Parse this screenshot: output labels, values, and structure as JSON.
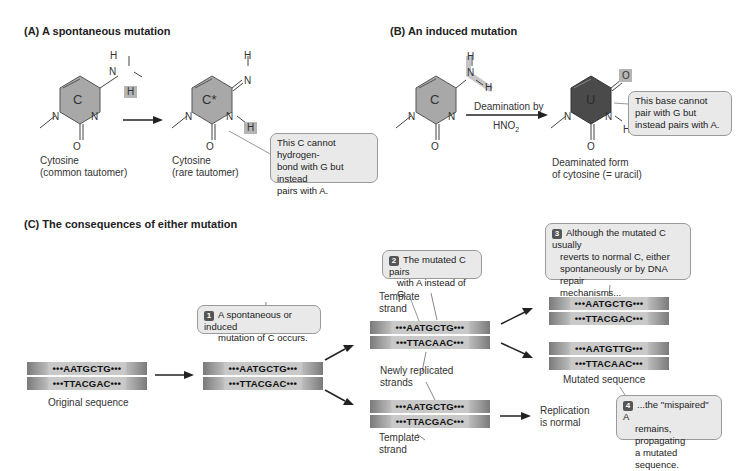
{
  "panel_a": {
    "title": "(A)  A spontaneous mutation",
    "molecule1": {
      "ring_label": "C",
      "atoms": {
        "h_top": "H",
        "n_amino": "N",
        "h_highlight": "H",
        "n_ring_left": "N",
        "n_ring_right": "N",
        "o": "O"
      },
      "caption_line1": "Cytosine",
      "caption_line2": "(common tautomer)"
    },
    "molecule2": {
      "ring_label": "C*",
      "atoms": {
        "h_top": "H",
        "n_imino": "N",
        "n_ring_left": "N",
        "n_ring_right": "N",
        "h_highlight": "H",
        "o": "O"
      },
      "caption_line1": "Cytosine",
      "caption_line2": "(rare tautomer)"
    },
    "callout": {
      "line1": "This C cannot hydrogen-",
      "line2": "bond with G but instead",
      "line3": "pairs with A."
    }
  },
  "panel_b": {
    "title": "(B)  An induced mutation",
    "molecule1": {
      "ring_label": "C",
      "atoms": {
        "h_top": "H",
        "n_amino": "N",
        "h_right": "H",
        "n_ring_left": "N",
        "n_ring_right": "N",
        "o": "O"
      }
    },
    "arrow_label_line1": "Deamination by",
    "arrow_label_line2": "HNO",
    "arrow_label_sub": "2",
    "molecule2": {
      "ring_label": "U",
      "atoms": {
        "o_highlight": "O",
        "n_ring_left": "N",
        "n_ring_right": "N",
        "h": "H",
        "o": "O"
      },
      "caption_line1": "Deaminated form",
      "caption_line2": "of cytosine (= uracil)"
    },
    "callout": {
      "line1": "This base cannot",
      "line2": "pair with G but",
      "line3": "instead pairs with A."
    }
  },
  "panel_c": {
    "title": "(C)  The consequences of either mutation",
    "original": {
      "top": "•••AATGCTG•••",
      "bottom": "•••TTACGAC•••",
      "caption": "Original sequence"
    },
    "mutated_c": {
      "top": "•••AATGCTG•••",
      "bottom": "•••TTACGAC•••"
    },
    "step1": {
      "num": "1",
      "line1": "A spontaneous or induced",
      "line2": "mutation of C occurs."
    },
    "step2": {
      "num": "2",
      "line1": "The mutated C pairs",
      "line2": "with A instead of G."
    },
    "step3": {
      "num": "3",
      "line1": "Although the mutated C usually",
      "line2": "reverts to normal C, either",
      "line3": "spontaneously or by DNA repair",
      "line4": "mechanisms..."
    },
    "step4": {
      "num": "4",
      "line1": "...the \"mispaired\" A",
      "line2": "remains, propagating",
      "line3": "a mutated sequence."
    },
    "replicated_upper": {
      "top": "•••AATGCTG•••",
      "bottom": "•••TTACAAC•••"
    },
    "replicated_lower": {
      "top": "•••AATGCTG•••",
      "bottom": "•••TTACGAC•••"
    },
    "template_strand_upper_l1": "Template",
    "template_strand_upper_l2": "strand",
    "newly_replicated_l1": "Newly replicated",
    "newly_replicated_l2": "strands",
    "template_strand_lower_l1": "Template",
    "template_strand_lower_l2": "strand",
    "reverted": {
      "top": "•••AATGCTG•••",
      "bottom": "•••TTACGAC•••"
    },
    "mutated": {
      "top": "•••AATGTTG•••",
      "bottom": "•••TTACAAC•••",
      "caption": "Mutated sequence"
    },
    "replication_normal_l1": "Replication",
    "replication_normal_l2": "is normal"
  },
  "colors": {
    "ring_light": "#a8a8a8",
    "ring_dark": "#4a4a4a",
    "highlight": "#b5b5b5",
    "callout_bg": "#e9e9e9"
  }
}
